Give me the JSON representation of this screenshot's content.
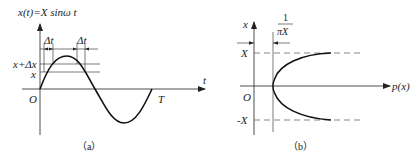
{
  "panel_a": {
    "title": "x(t)=X sinω t",
    "delta_t_left": "Δt",
    "delta_t_right": "Δt",
    "label_x_plus_dx": "x+Δx",
    "label_x": "x",
    "axis_t": "t",
    "origin": "O",
    "period": "T",
    "caption": "（a）"
  },
  "panel_b": {
    "axis_x": "x",
    "frac_num": "1",
    "frac_den": "πX",
    "label_X": "X",
    "label_negX": "-X",
    "origin": "O",
    "axis_px": "p(x)",
    "caption": "（b）"
  },
  "colors": {
    "line": "#222222",
    "curve": "#111111",
    "dash": "#555555"
  }
}
